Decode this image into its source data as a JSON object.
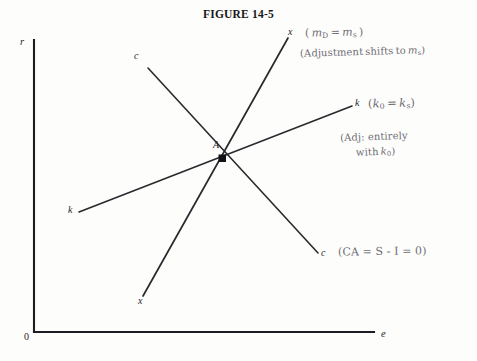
{
  "figure": {
    "title": "FIGURE 14-5",
    "background_color": "#fdfdfc",
    "axis_color": "#1d1c20",
    "curve_color": "#2a292e",
    "annotation_color": "#6f6d74"
  },
  "axes": {
    "y_label": "r",
    "x_label": "e",
    "origin_label": "0"
  },
  "curves": [
    {
      "name": "c-curve",
      "label_top": "c",
      "label_bottom": "c",
      "description": "downward sloping current account schedule"
    },
    {
      "name": "x-curve",
      "label_top": "x",
      "label_bottom": "x",
      "description": "steep upward sloping money market schedule"
    },
    {
      "name": "k-curve",
      "label_left": "k",
      "label_right": "k",
      "description": "shallow upward sloping capital account schedule"
    }
  ],
  "equilibrium": {
    "point_label": "A"
  },
  "annotations": [
    {
      "name": "money-market-equilibrium",
      "line1": "( m",
      "line1_sub": "D",
      "line1_rest": " = m",
      "line1_sub2": "s",
      "line1_end": ")"
    },
    {
      "name": "adjustment-shift",
      "text": "(Adjustment shifts to m",
      "sub": "s",
      "end": ")"
    },
    {
      "name": "capital-equilibrium",
      "text": "(k",
      "sub": "0",
      "mid": " = k",
      "sub2": "s",
      "end": ")"
    },
    {
      "name": "adjustment-entirely",
      "line1": "(Adj: entirely",
      "line2": "with k",
      "line2_sub": "0",
      "line2_end": ")"
    },
    {
      "name": "current-account-balance",
      "text": "(CA = S - I = 0)"
    }
  ],
  "geometry": {
    "y_axis_x": 34,
    "y_axis_top": 40,
    "x_axis_y": 332,
    "x_axis_right": 374,
    "intersection": {
      "x": 222,
      "y": 158
    },
    "c_curve": {
      "x1": 148,
      "y1": 68,
      "x2": 318,
      "y2": 253
    },
    "x_curve": {
      "x1": 288,
      "y1": 38,
      "x2": 143,
      "y2": 296
    },
    "k_curve": {
      "x1": 79,
      "y1": 212,
      "x2": 352,
      "y2": 106
    }
  }
}
